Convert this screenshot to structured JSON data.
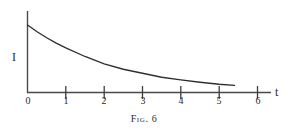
{
  "figure": {
    "caption": "Fig. 6",
    "caption_word": "Fig.",
    "caption_number": "6",
    "ink_color": "#2a2a2a",
    "background_color": "#ffffff"
  },
  "axes": {
    "y_axis_label": "I",
    "x_axis_label": "t",
    "x_tick_labels": [
      "0",
      "1",
      "2",
      "3",
      "4",
      "5",
      "6"
    ]
  },
  "chart_data": {
    "type": "line",
    "title": "Fig. 6",
    "xlabel": "t",
    "ylabel": "I",
    "xlim": [
      0,
      6.35
    ],
    "ylim": [
      0,
      1.0
    ],
    "grid": false,
    "legend": null,
    "xticks": [
      0,
      1,
      2,
      3,
      4,
      5,
      6
    ],
    "xticklabels": [
      "0",
      "1",
      "2",
      "3",
      "4",
      "5",
      "6"
    ],
    "yticks": [],
    "yticklabels": [],
    "series": [
      {
        "name": "I(t)",
        "formula": "I = I0 * exp(-0.43 t)",
        "x": [
          0,
          0.25,
          0.5,
          0.75,
          1,
          1.5,
          2,
          2.5,
          3,
          3.5,
          4,
          4.5,
          5,
          5.4
        ],
        "y": [
          1.0,
          0.9,
          0.81,
          0.73,
          0.66,
          0.53,
          0.42,
          0.34,
          0.28,
          0.22,
          0.18,
          0.145,
          0.116,
          0.098
        ]
      }
    ]
  }
}
